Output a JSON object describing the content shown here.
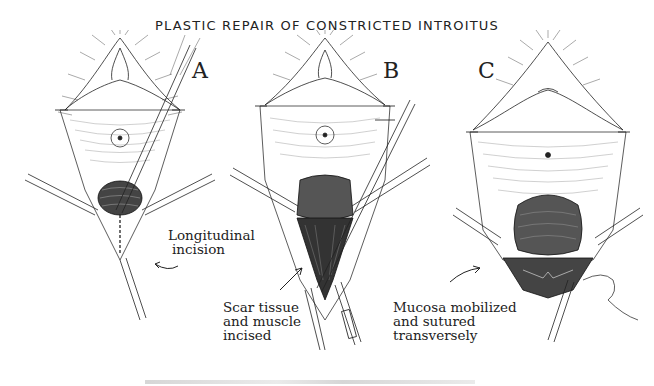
{
  "figure": {
    "title": "PLASTIC REPAIR OF CONSTRICTED INTROITUS",
    "panels": [
      {
        "letter": "A",
        "annotation": [
          "Longitudinal",
          "incision"
        ]
      },
      {
        "letter": "B",
        "annotation": [
          "Scar tissue",
          "and muscle",
          "incised"
        ]
      },
      {
        "letter": "C",
        "annotation": [
          "Mucosa mobilized",
          "and sutured",
          "transversely"
        ]
      }
    ],
    "colors": {
      "ink": "#1a1a1a",
      "background": "#ffffff"
    }
  }
}
